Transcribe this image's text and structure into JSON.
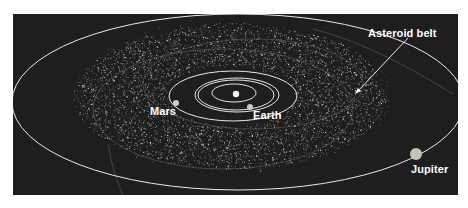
{
  "diagram": {
    "background_color": "#1e1e1e",
    "orbit_color": "#e8e8e8",
    "labels": {
      "asteroid_belt": "Asteroid belt",
      "mars": "Mars",
      "earth": "Earth",
      "jupiter": "Jupiter"
    },
    "bodies": [
      {
        "name": "Sun",
        "x": 223,
        "y": 80,
        "r": 3.2,
        "color": "#f4f4f4"
      },
      {
        "name": "Earth",
        "x": 237,
        "y": 93,
        "r": 3,
        "color": "#c8c8c8"
      },
      {
        "name": "Mars",
        "x": 163,
        "y": 89,
        "r": 3,
        "color": "#d0d0d0"
      },
      {
        "name": "Jupiter",
        "x": 403,
        "y": 140,
        "r": 6,
        "color": "#c9c2b6"
      }
    ],
    "orbits": [
      {
        "name": "inner-orbit",
        "cx": 221,
        "cy": 79,
        "rx": 22,
        "ry": 9
      },
      {
        "name": "venus-orbit",
        "cx": 223,
        "cy": 81,
        "rx": 38,
        "ry": 15
      },
      {
        "name": "earth-orbit",
        "cx": 224,
        "cy": 81,
        "rx": 42,
        "ry": 17
      },
      {
        "name": "mars-orbit",
        "cx": 220,
        "cy": 82,
        "rx": 64,
        "ry": 25
      },
      {
        "name": "jupiter-orbit",
        "cx": 225,
        "cy": 88,
        "rx": 226,
        "ry": 88
      }
    ]
  }
}
